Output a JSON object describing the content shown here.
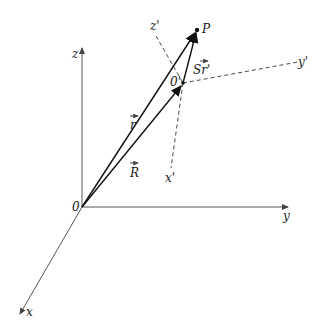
{
  "diagram": {
    "type": "3d-coordinate-frames",
    "colors": {
      "ink": "#1a1a1a",
      "axis": "#555555",
      "dashed": "#333333",
      "background": "#ffffff"
    },
    "labels": {
      "z": "z",
      "y": "y",
      "x": "x",
      "origin": "0",
      "z_prime": "z'",
      "y_prime": "y'",
      "x_prime": "x'",
      "origin_prime": "0'",
      "point": "P",
      "vec_r": "r",
      "vec_R": "R",
      "vec_dr_prime": "Sr'"
    },
    "points": {
      "O": [
        82,
        207
      ],
      "O_prime": [
        183,
        83
      ],
      "P": [
        197,
        30
      ]
    },
    "vectors": [
      {
        "name": "r",
        "from": "O",
        "to": "P"
      },
      {
        "name": "R",
        "from": "O",
        "to": "O'"
      },
      {
        "name": "Sr'",
        "from": "O'",
        "to": "P"
      }
    ],
    "axes": {
      "fixed": [
        "x",
        "y",
        "z"
      ],
      "moving": [
        "x'",
        "y'",
        "z'"
      ]
    }
  }
}
